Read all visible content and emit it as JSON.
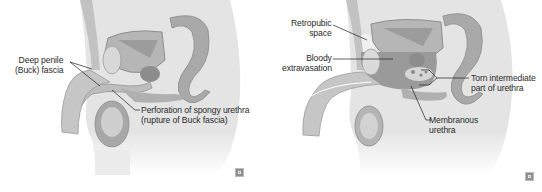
{
  "figure": {
    "style": "grayscale medical illustration, sagittal section of male pelvis",
    "panels": [
      {
        "id": "left",
        "labels": [
          {
            "key": "deep_fascia",
            "lines": [
              "Deep penile",
              "(Buck) fascia"
            ]
          },
          {
            "key": "perforation",
            "lines": [
              "Perforation of spongy urethra",
              "(rupture of Buck fascia)"
            ]
          }
        ]
      },
      {
        "id": "right",
        "labels": [
          {
            "key": "retropubic",
            "lines": [
              "Retropubic",
              "space"
            ]
          },
          {
            "key": "bloody",
            "lines": [
              "Bloody",
              "extravasation"
            ]
          },
          {
            "key": "torn",
            "lines": [
              "Torn intermediate",
              "part of urethra"
            ]
          },
          {
            "key": "membranous",
            "lines": [
              "Membranous",
              "urethra"
            ]
          }
        ]
      }
    ],
    "badge_icon": "publisher-logo-icon",
    "colors": {
      "background": "#ffffff",
      "body_fill": "#e3e3e3",
      "organ_fill": "#b9b9b9",
      "organ_dark": "#8e8e8e",
      "text": "#2a2a2a",
      "leader": "#1f1f1f"
    }
  }
}
